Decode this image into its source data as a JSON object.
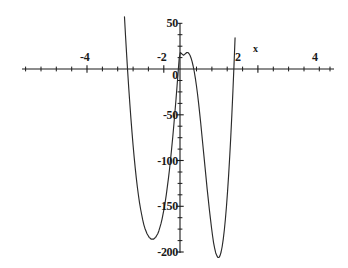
{
  "chart_data": {
    "type": "line",
    "title": "",
    "subtitle": "",
    "xlabel": "x",
    "ylabel": "",
    "xlim": [
      -4.85,
      4.85
    ],
    "ylim": [
      -205,
      58
    ],
    "grid": false,
    "legend": null,
    "x_ticks": [
      -4,
      -2,
      2,
      4
    ],
    "x_tick_labels": [
      "-4",
      "-2",
      "2",
      "4"
    ],
    "x_minor_tick_step": 0.5,
    "y_ticks": [
      50,
      0,
      -50,
      -100,
      -150,
      -200
    ],
    "y_tick_labels": [
      "50",
      "0",
      "-50",
      "-100",
      "-150",
      "-200"
    ],
    "y_minor_tick_step": 12.5,
    "curve_color": "#2b2b2b",
    "axis_color": "#1a1a1a",
    "background_color": "#ffffff",
    "annotations": [],
    "roots_x": [
      -3.2,
      0.0,
      1.15,
      3.7
    ],
    "local_minima": [
      {
        "x": -2.2,
        "y": -195
      },
      {
        "x": 2.85,
        "y": -123
      }
    ],
    "local_maxima": [
      {
        "x": 0.5,
        "y": 18
      }
    ],
    "series": [
      {
        "name": "f(x)",
        "x": [
          -3.62,
          -3.55,
          -3.48,
          -3.41,
          -3.34,
          -3.27,
          -3.2,
          -3.13,
          -3.06,
          -2.99,
          -2.92,
          -2.85,
          -2.78,
          -2.71,
          -2.64,
          -2.57,
          -2.5,
          -2.43,
          -2.36,
          -2.29,
          -2.22,
          -2.15,
          -2.08,
          -2.01,
          -1.94,
          -1.87,
          -1.8,
          -1.73,
          -1.66,
          -1.59,
          -1.52,
          -1.45,
          -1.38,
          -1.31,
          -1.24,
          -1.17,
          -1.1,
          -1.03,
          -0.96,
          -0.89,
          -0.82,
          -0.75,
          -0.68,
          -0.61,
          -0.54,
          -0.47,
          -0.4,
          -0.33,
          -0.26,
          -0.19,
          -0.12,
          -0.05,
          0.02,
          0.09,
          0.16,
          0.23,
          0.3,
          0.37,
          0.44,
          0.51,
          0.58,
          0.65,
          0.72,
          0.79,
          0.86,
          0.93,
          1.0,
          1.07,
          1.14,
          1.21,
          1.28,
          1.35,
          1.42,
          1.49,
          1.56,
          1.63,
          1.7,
          1.77,
          1.84,
          1.91,
          1.98,
          2.05,
          2.12,
          2.19,
          2.26,
          2.33,
          2.4,
          2.47,
          2.54,
          2.61,
          2.68,
          2.75,
          2.82,
          2.89,
          2.96,
          3.03,
          3.1,
          3.17,
          3.24,
          3.31,
          3.38,
          3.45,
          3.52,
          3.59,
          3.66,
          3.73,
          3.8,
          3.87,
          3.94,
          4.01
        ],
        "y": [
          57,
          36,
          16,
          -3,
          -21,
          -38,
          -54,
          -69,
          -83,
          -96,
          -108,
          -119,
          -129,
          -138,
          -146,
          -153,
          -159,
          -165,
          -170,
          -174,
          -177,
          -180,
          -182,
          -184,
          -185,
          -186,
          -186,
          -186,
          -185,
          -184,
          -182,
          -180,
          -177,
          -173,
          -169,
          -164,
          -158,
          -152,
          -145,
          -137,
          -128,
          -119,
          -109,
          -98,
          -86,
          -74,
          -61,
          -47,
          -33,
          -18,
          -3,
          12,
          18,
          17,
          16,
          15,
          16,
          17,
          18,
          18,
          17,
          15,
          12,
          8,
          3,
          -3,
          -10,
          -18,
          -27,
          -37,
          -48,
          -59,
          -71,
          -83,
          -95,
          -107,
          -119,
          -131,
          -142,
          -153,
          -163,
          -173,
          -182,
          -190,
          -196,
          -201,
          -204,
          -206,
          -206,
          -204,
          -200,
          -194,
          -186,
          -176,
          -164,
          -150,
          -134,
          -116,
          -96,
          -74,
          -50,
          -24,
          4,
          34,
          66,
          100,
          136,
          174,
          214,
          256
        ]
      }
    ]
  },
  "axis_labels": {
    "x_axis_name": "x",
    "y_50": "50",
    "y_0": "0",
    "y_neg50": "-50",
    "y_neg100": "-100",
    "y_neg150": "-150",
    "y_neg200": "-200",
    "x_neg4": "-4",
    "x_neg2": "-2",
    "x_2": "2",
    "x_4": "4"
  }
}
